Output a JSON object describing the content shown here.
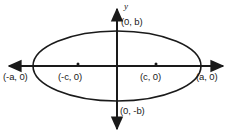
{
  "figure": {
    "kind": "ellipse-diagram",
    "stroke_color": "#1a1a1a",
    "background_color": "#ffffff",
    "center": {
      "x": 117,
      "y": 66
    },
    "semi_axis_a": 84,
    "semi_axis_b": 35,
    "focus_offset_c": 39,
    "axes": {
      "y_label": "y",
      "x_axis_y": 66,
      "y_axis_x": 117,
      "x_left_tip": 3,
      "x_right_tip": 229,
      "y_top_tip": 3,
      "y_bottom_tip": 135
    },
    "focus_dots": [
      {
        "name": "focus-left",
        "x": 78,
        "y": 64
      },
      {
        "name": "focus-right",
        "x": 156,
        "y": 64
      }
    ],
    "labels": {
      "vertex_left": "(-a, 0)",
      "vertex_right": "(a, 0)",
      "focus_left": "(-c, 0)",
      "focus_right": "(c, 0)",
      "covertex_top": "(0, b)",
      "covertex_bottom": "(0, -b)"
    }
  }
}
